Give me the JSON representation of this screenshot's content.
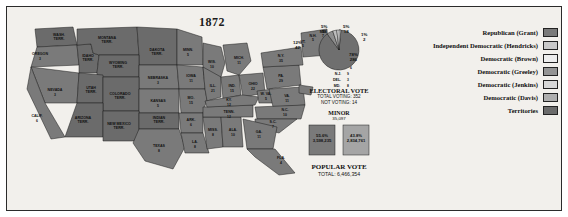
{
  "map": {
    "title": "1872",
    "states": [
      {
        "abbr": "WASH. TERR.",
        "num": "",
        "x": 52,
        "y": 29
      },
      {
        "abbr": "OREGON",
        "num": "3",
        "x": 33,
        "y": 48
      },
      {
        "abbr": "IDAHO TERR.",
        "num": "",
        "x": 66,
        "y": 52
      },
      {
        "abbr": "MONTANA TERR.",
        "num": "",
        "x": 100,
        "y": 33
      },
      {
        "abbr": "DAKOTA TERR.",
        "num": "",
        "x": 147,
        "y": 47
      },
      {
        "abbr": "MINN.",
        "num": "5",
        "x": 180,
        "y": 47
      },
      {
        "abbr": "WIS.",
        "num": "10",
        "x": 203,
        "y": 62
      },
      {
        "abbr": "MICH.",
        "num": "11",
        "x": 228,
        "y": 55
      },
      {
        "abbr": "NEVADA",
        "num": "3",
        "x": 47,
        "y": 86
      },
      {
        "abbr": "UTAH TERR.",
        "num": "",
        "x": 76,
        "y": 84
      },
      {
        "abbr": "WYOMING TERR.",
        "num": "",
        "x": 110,
        "y": 61
      },
      {
        "abbr": "NEBRASKA",
        "num": "3",
        "x": 150,
        "y": 76
      },
      {
        "abbr": "IOWA",
        "num": "11",
        "x": 183,
        "y": 73
      },
      {
        "abbr": "ILL.",
        "num": "21",
        "x": 206,
        "y": 83
      },
      {
        "abbr": "IND.",
        "num": "15",
        "x": 227,
        "y": 84
      },
      {
        "abbr": "OHIO",
        "num": "22",
        "x": 246,
        "y": 80
      },
      {
        "abbr": "PA.",
        "num": "29",
        "x": 272,
        "y": 74
      },
      {
        "abbr": "N.Y.",
        "num": "35",
        "x": 278,
        "y": 54
      },
      {
        "abbr": "VT.",
        "num": "5",
        "x": 297,
        "y": 38
      },
      {
        "abbr": "N.H.",
        "num": "5",
        "x": 304,
        "y": 33
      },
      {
        "abbr": "ME.",
        "num": "7",
        "x": 313,
        "y": 29
      },
      {
        "abbr": "MASS.",
        "num": "13",
        "x": 326,
        "y": 48
      },
      {
        "abbr": "R.I.",
        "num": "4",
        "x": 324,
        "y": 57
      },
      {
        "abbr": "CONN.",
        "num": "6",
        "x": 321,
        "y": 64
      },
      {
        "abbr": "N.J.",
        "num": "9",
        "x": 320,
        "y": 72
      },
      {
        "abbr": "DEL.",
        "num": "3",
        "x": 318,
        "y": 80
      },
      {
        "abbr": "MD.",
        "num": "8",
        "x": 318,
        "y": 88
      },
      {
        "abbr": "CALIF.",
        "num": "6",
        "x": 28,
        "y": 113
      },
      {
        "abbr": "ARIZONA TERR.",
        "num": "",
        "x": 67,
        "y": 122
      },
      {
        "abbr": "COLORADO TERR.",
        "num": "",
        "x": 112,
        "y": 95
      },
      {
        "abbr": "KANSAS",
        "num": "5",
        "x": 152,
        "y": 99
      },
      {
        "abbr": "MO.",
        "num": "15",
        "x": 182,
        "y": 95
      },
      {
        "abbr": "KY.",
        "num": "12",
        "x": 232,
        "y": 97
      },
      {
        "abbr": "W. VA.",
        "num": "5",
        "x": 256,
        "y": 91
      },
      {
        "abbr": "VA.",
        "num": "11",
        "x": 277,
        "y": 95
      },
      {
        "abbr": "TENN.",
        "num": "12",
        "x": 227,
        "y": 108
      },
      {
        "abbr": "N.C.",
        "num": "10",
        "x": 276,
        "y": 106
      },
      {
        "abbr": "S.C.",
        "num": "7",
        "x": 267,
        "y": 117
      },
      {
        "abbr": "GA.",
        "num": "11",
        "x": 254,
        "y": 125
      },
      {
        "abbr": "ALA.",
        "num": "10",
        "x": 231,
        "y": 124
      },
      {
        "abbr": "MISS.",
        "num": "8",
        "x": 211,
        "y": 125
      },
      {
        "abbr": "ARK.",
        "num": "6",
        "x": 186,
        "y": 116
      },
      {
        "abbr": "LA.",
        "num": "8",
        "x": 190,
        "y": 137
      },
      {
        "abbr": "TEXAS",
        "num": "8",
        "x": 152,
        "y": 142
      },
      {
        "abbr": "NEW MEXICO TERR.",
        "num": "",
        "x": 105,
        "y": 124
      },
      {
        "abbr": "INDIAN TERR.",
        "num": "",
        "x": 155,
        "y": 117
      },
      {
        "abbr": "FLA.",
        "num": "4",
        "x": 272,
        "y": 152
      }
    ]
  },
  "stats": {
    "pie": {
      "slices": [
        {
          "label": "Republican (Grant)",
          "pct": "78%",
          "votes": "286",
          "color": "#6f6f6f"
        },
        {
          "label": "Independent Democratic (Hendricks)",
          "pct": "5%",
          "votes": "18",
          "color": "#bdbdbd"
        },
        {
          "label": "Democratic (Brown)",
          "pct": "5%",
          "votes": "18",
          "color": "#e8e8e8"
        },
        {
          "label": "Democratic (Greeley)",
          "pct": "12%",
          "votes": "42",
          "color": "#8e8e8e"
        },
        {
          "label": "Democratic (Jenkins)",
          "pct": "1%",
          "votes": "2",
          "color": "#d0d0d0"
        },
        {
          "label": "Democratic (Davis)",
          "pct": "0%",
          "votes": "1",
          "color": "#a8a8a8"
        }
      ],
      "labels": [
        {
          "text": "5%\n18",
          "x": 32,
          "y": -1
        },
        {
          "text": "5%\n18",
          "x": 58,
          "y": -1
        },
        {
          "text": "1%\n2",
          "x": 76,
          "y": 10
        },
        {
          "text": "78%\n286",
          "x": 64,
          "y": 30
        },
        {
          "text": "12%\n42",
          "x": 2,
          "y": 17
        }
      ]
    },
    "electoral": {
      "heading": "ELECTORAL VOTE",
      "total": "TOTAL VOTING: 352",
      "notvoting": "NOT VOTING: 14"
    },
    "minor": {
      "heading": "MINOR",
      "value": "35,097"
    },
    "bars": [
      {
        "label": "55.6%\n3,598,235",
        "pct": "55.6%"
      },
      {
        "label": "43.8%\n2,834,761",
        "pct": "43.8%"
      }
    ],
    "popular": {
      "heading": "POPULAR VOTE",
      "total": "TOTAL: 6,466,354"
    }
  },
  "legend": {
    "items": [
      {
        "label": "Republican (Grant)",
        "color": "#7a7a7a"
      },
      {
        "label": "Independent Democratic (Hendricks)",
        "color": "#c8c8c8"
      },
      {
        "label": "Democratic (Brown)",
        "color": "#ededed"
      },
      {
        "label": "Democratic (Greeley)",
        "color": "#949494"
      },
      {
        "label": "Democratic (Jenkins)",
        "color": "#d8d8d8"
      },
      {
        "label": "Democratic (Davis)",
        "color": "#aeaeae"
      },
      {
        "label": "Territories",
        "color": "#6b6b6b"
      }
    ]
  }
}
